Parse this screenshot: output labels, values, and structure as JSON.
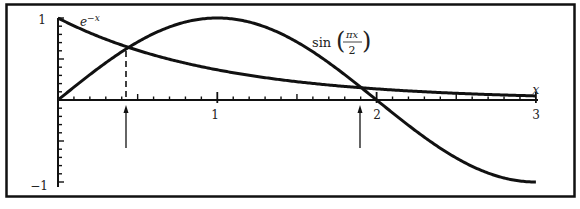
{
  "chart_data": {
    "type": "line",
    "title": "",
    "xlabel": "x",
    "ylabel": "",
    "xlim": [
      0,
      3
    ],
    "ylim": [
      -1,
      1
    ],
    "x_ticks": [
      1,
      2,
      3
    ],
    "x_tick_labels": [
      "1",
      "2",
      "3"
    ],
    "x_minor_tick_step": 0.1,
    "y_ticks": [
      1,
      -1
    ],
    "y_tick_labels": [
      "1",
      "−1"
    ],
    "y_minor_tick_step": 0.1,
    "grid": false,
    "legend": "inline curve labels",
    "series": [
      {
        "name": "e^{-x}",
        "label": "e",
        "label_sup": "−x",
        "x": [
          0,
          0.25,
          0.5,
          0.75,
          1.0,
          1.25,
          1.5,
          1.75,
          2.0,
          2.25,
          2.5,
          2.75,
          3.0
        ],
        "values": [
          1.0,
          0.779,
          0.607,
          0.472,
          0.368,
          0.287,
          0.223,
          0.174,
          0.135,
          0.105,
          0.082,
          0.064,
          0.05
        ]
      },
      {
        "name": "sin(πx/2)",
        "label": "sin",
        "label_num": "πx",
        "label_den": "2",
        "x": [
          0,
          0.25,
          0.5,
          0.75,
          1.0,
          1.25,
          1.5,
          1.75,
          2.0,
          2.25,
          2.5,
          2.75,
          3.0
        ],
        "values": [
          0.0,
          0.383,
          0.707,
          0.924,
          1.0,
          0.924,
          0.707,
          0.383,
          0.0,
          -0.383,
          -0.707,
          -0.924,
          -1.0
        ]
      }
    ],
    "annotations": [
      {
        "type": "intersection",
        "x": 0.44,
        "y": 0.64,
        "dashed_drop_line": true,
        "arrow_below_axis": true
      },
      {
        "type": "intersection",
        "x": 1.9,
        "y": 0.15,
        "dashed_drop_line": false,
        "arrow_below_axis": true
      }
    ]
  },
  "labels": {
    "x_axis": "x",
    "y_top": "1",
    "y_bottom": "−1",
    "x1": "1",
    "x2": "2",
    "x3": "3",
    "exp_base": "e",
    "exp_sup": "−x",
    "sin_fn": "sin",
    "sin_num": "πx",
    "sin_den": "2"
  },
  "colors": {
    "ink": "#111111",
    "background": "#ffffff"
  }
}
